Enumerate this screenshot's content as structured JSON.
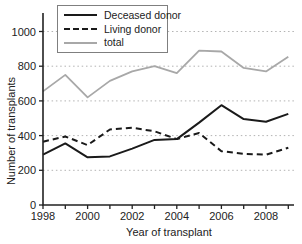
{
  "chart_data": {
    "type": "line",
    "title": "",
    "xlabel": "Year of transplant",
    "ylabel": "Number of transplants",
    "x": [
      1998,
      1999,
      2000,
      2001,
      2002,
      2003,
      2004,
      2005,
      2006,
      2007,
      2008,
      2009
    ],
    "x_tick_years": [
      1998,
      2000,
      2002,
      2004,
      2006,
      2008
    ],
    "y_ticks": [
      0,
      200,
      400,
      600,
      800,
      1000
    ],
    "xlim": [
      1998,
      2009
    ],
    "ylim": [
      0,
      1000
    ],
    "grid": "horizontal dotted",
    "legend_position": "top-left inside",
    "series": [
      {
        "name": "Deceased donor",
        "style": "solid",
        "color": "#1a1a1a",
        "width": 2,
        "values": [
          290,
          355,
          275,
          280,
          325,
          375,
          380,
          475,
          575,
          495,
          480,
          525
        ]
      },
      {
        "name": "Living donor",
        "style": "dashed",
        "color": "#1a1a1a",
        "width": 2,
        "values": [
          365,
          395,
          345,
          435,
          445,
          425,
          380,
          415,
          310,
          295,
          290,
          330
        ]
      },
      {
        "name": "total",
        "style": "solid",
        "color": "#a8a8a8",
        "width": 1.8,
        "values": [
          655,
          750,
          620,
          715,
          770,
          800,
          760,
          890,
          885,
          790,
          770,
          855
        ]
      }
    ],
    "colors": {
      "axis": "#222222",
      "text": "#222222",
      "grid": "#b3b3b3",
      "background": "#ffffff"
    }
  }
}
